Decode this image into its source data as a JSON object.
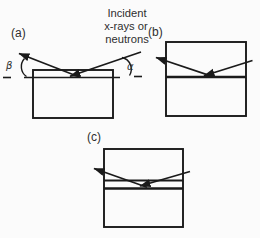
{
  "figure": {
    "colors": {
      "background": "#fbfbfb",
      "ink": "#1a1a1a",
      "text": "#2e2e2e"
    },
    "caption": {
      "line1": "Incident",
      "line2": "x-rays or",
      "line3": "neutrons"
    },
    "panels": {
      "a": {
        "label": "(a)",
        "exit_angle_symbol": "β",
        "incident_angle_symbol": "α"
      },
      "b": {
        "label": "(b)"
      },
      "c": {
        "label": "(c)"
      }
    }
  }
}
